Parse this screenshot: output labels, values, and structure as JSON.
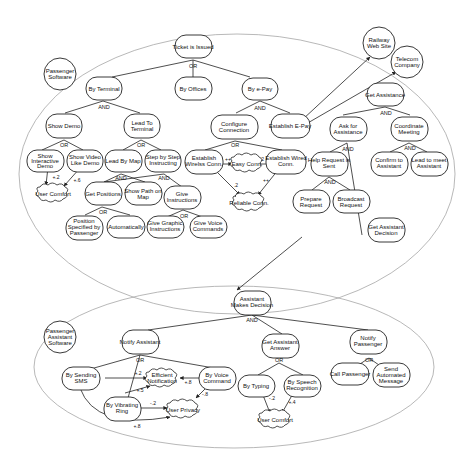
{
  "diagram": {
    "type": "i* goal model",
    "actors": [
      {
        "id": "passenger_software",
        "label_lines": [
          "Passenger",
          "Software"
        ]
      },
      {
        "id": "railway",
        "label_lines": [
          "Railway",
          "Web Site"
        ]
      },
      {
        "id": "telecom",
        "label_lines": [
          "Telecom",
          "Company"
        ]
      },
      {
        "id": "pas_assistant_software",
        "label_lines": [
          "Passenger",
          "Assistant",
          "Software"
        ]
      }
    ],
    "goals_top": [
      {
        "id": "ticket",
        "label_lines": [
          "Ticket is Issued"
        ],
        "op": "OR"
      },
      {
        "id": "by_terminal",
        "label_lines": [
          "By Terminal"
        ],
        "op": "AND"
      },
      {
        "id": "by_offices",
        "label_lines": [
          "By Offices"
        ]
      },
      {
        "id": "by_epay",
        "label_lines": [
          "By e-Pay"
        ],
        "op": "AND"
      },
      {
        "id": "show_demo",
        "label_lines": [
          "Show Demo"
        ],
        "op": "OR"
      },
      {
        "id": "lead_terminal",
        "label_lines": [
          "Lead To",
          "Terminal"
        ],
        "op": "OR"
      },
      {
        "id": "configure_conn",
        "label_lines": [
          "Configure",
          "Connection"
        ],
        "op": "OR"
      },
      {
        "id": "establish_epay",
        "label_lines": [
          "Establish E-Pay"
        ]
      },
      {
        "id": "get_assistance",
        "label_lines": [
          "Get  Assistance"
        ],
        "op": "AND"
      },
      {
        "id": "ask_assistance",
        "label_lines": [
          "Ask for",
          "Assistance"
        ],
        "op": "AND"
      },
      {
        "id": "coordinate_meeting",
        "label_lines": [
          "Coordinate",
          "Meeting"
        ],
        "op": "AND"
      },
      {
        "id": "show_interactive",
        "label_lines": [
          "Show",
          "Interactive",
          "Demo"
        ]
      },
      {
        "id": "show_video",
        "label_lines": [
          "Show Video",
          "Like Demo"
        ]
      },
      {
        "id": "lead_by_map",
        "label_lines": [
          "Lead By Map"
        ],
        "op": "AND"
      },
      {
        "id": "step_by_step",
        "label_lines": [
          "Step by Step",
          "Instructing"
        ],
        "op": "AND"
      },
      {
        "id": "establish_wireless",
        "label_lines": [
          "Establish",
          "Wirelss Conn."
        ]
      },
      {
        "id": "establish_wired",
        "label_lines": [
          "Establish Wired",
          "Conn."
        ]
      },
      {
        "id": "help_request",
        "label_lines": [
          "Help Request is",
          "Sent"
        ],
        "op": "AND"
      },
      {
        "id": "confirm_assistant",
        "label_lines": [
          "Confirm to",
          "Assistant"
        ]
      },
      {
        "id": "lead_meet",
        "label_lines": [
          "Lead to meet",
          "Assistant"
        ]
      },
      {
        "id": "get_positions",
        "label_lines": [
          "Get Positions"
        ],
        "op": "OR"
      },
      {
        "id": "show_path",
        "label_lines": [
          "Show Path on",
          "Map"
        ]
      },
      {
        "id": "give_instructions",
        "label_lines": [
          "Give",
          "Instructions"
        ],
        "op": "OR"
      },
      {
        "id": "prepare_request",
        "label_lines": [
          "Prepare",
          "Request"
        ]
      },
      {
        "id": "broadcast_request",
        "label_lines": [
          "Broadcast",
          "Request"
        ]
      },
      {
        "id": "position_specified",
        "label_lines": [
          "Position",
          "Specified by",
          "Passenger"
        ]
      },
      {
        "id": "automatically",
        "label_lines": [
          "Automatically"
        ]
      },
      {
        "id": "give_graphic",
        "label_lines": [
          "Give Graphic",
          "Instructions"
        ]
      },
      {
        "id": "give_voice",
        "label_lines": [
          "Give Voice",
          "Commands"
        ]
      },
      {
        "id": "get_assistant_decision",
        "label_lines": [
          "Get Assistant",
          "Decision"
        ]
      }
    ],
    "softgoals_top": [
      {
        "id": "user_comfort_1",
        "label": "User Comfort"
      },
      {
        "id": "easy_conn",
        "label": "Easy Conn."
      },
      {
        "id": "reliable_conn",
        "label": "Reliable Conn."
      }
    ],
    "goals_bottom": [
      {
        "id": "assistant_decision",
        "label_lines": [
          "Assistant",
          "Makes Decision"
        ],
        "op": "AND"
      },
      {
        "id": "notify_assistant",
        "label_lines": [
          "Notify Assistant"
        ],
        "op": "OR"
      },
      {
        "id": "get_answer",
        "label_lines": [
          "Get Assistant",
          "Answer"
        ],
        "op": "OR"
      },
      {
        "id": "notify_passenger",
        "label_lines": [
          "Notify",
          "Passenger"
        ],
        "op": "OR"
      },
      {
        "id": "by_sms",
        "label_lines": [
          "By Sending",
          "SMS"
        ]
      },
      {
        "id": "by_voice",
        "label_lines": [
          "By Voice",
          "Command"
        ]
      },
      {
        "id": "by_vibrating",
        "label_lines": [
          "By Vibrating",
          "Ring"
        ]
      },
      {
        "id": "by_typing",
        "label_lines": [
          "By Typing"
        ]
      },
      {
        "id": "by_speech",
        "label_lines": [
          "By Speech",
          "Recognition"
        ]
      },
      {
        "id": "call_passenger",
        "label_lines": [
          "Call Passenger"
        ]
      },
      {
        "id": "send_message",
        "label_lines": [
          "Send",
          "Automated",
          "Message"
        ]
      }
    ],
    "softgoals_bottom": [
      {
        "id": "efficient_notif",
        "label_lines": [
          "Efficient",
          "Notification"
        ]
      },
      {
        "id": "user_privacy",
        "label": "User Privacy"
      },
      {
        "id": "user_comfort_2",
        "label": "User Comfort"
      }
    ],
    "contributions": [
      {
        "from": "show_interactive",
        "to": "user_comfort_1",
        "label": "+.2"
      },
      {
        "from": "show_video",
        "to": "user_comfort_1",
        "label": "+.6"
      },
      {
        "from": "establish_wireless",
        "to": "easy_conn",
        "label": "++"
      },
      {
        "from": "establish_wired",
        "to": "easy_conn",
        "label": ".2"
      },
      {
        "from": "establish_wireless",
        "to": "reliable_conn",
        "label": ".2"
      },
      {
        "from": "establish_wired",
        "to": "reliable_conn",
        "label": "++"
      },
      {
        "from": "by_sms",
        "to": "efficient_notif",
        "label": "+.2"
      },
      {
        "from": "by_vibrating",
        "to": "efficient_notif",
        "label": "+.5"
      },
      {
        "from": "by_voice",
        "to": "efficient_notif",
        "label": "+.8"
      },
      {
        "from": "by_vibrating",
        "to": "user_privacy",
        "label": "-.2"
      },
      {
        "from": "by_voice",
        "to": "user_privacy",
        "label": "-.8"
      },
      {
        "from": "by_sms",
        "to": "user_privacy",
        "label": "+.8"
      },
      {
        "from": "by_typing",
        "to": "user_comfort_2",
        "label": "-.2"
      },
      {
        "from": "by_speech",
        "to": "user_comfort_2",
        "label": "+.4"
      }
    ],
    "op_labels": {
      "and": "AND",
      "or": "OR"
    }
  }
}
